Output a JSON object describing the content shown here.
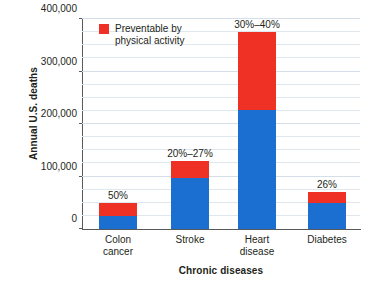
{
  "chart_data": {
    "type": "bar",
    "stacked": true,
    "title": "",
    "xlabel": "Chronic diseases",
    "ylabel": "Annual U.S. deaths",
    "categories": [
      "Colon cancer",
      "Stroke",
      "Heart disease",
      "Diabetes"
    ],
    "category_lines": [
      [
        "Colon",
        "cancer"
      ],
      [
        "Stroke"
      ],
      [
        "Heart",
        "disease"
      ],
      [
        "Diabetes"
      ]
    ],
    "series": [
      {
        "name": "Not preventable by physical activity",
        "color": "#1a6fd0",
        "values": [
          25000,
          97000,
          227000,
          50000
        ]
      },
      {
        "name": "Preventable by physical activity",
        "color": "#ee3124",
        "values": [
          25000,
          33000,
          148000,
          20000
        ]
      }
    ],
    "totals": [
      50000,
      130000,
      375000,
      70000
    ],
    "data_labels": [
      "50%",
      "20%–27%",
      "30%–40%",
      "26%"
    ],
    "ylim": [
      0,
      400000
    ],
    "yticks": [
      0,
      100000,
      200000,
      300000,
      400000
    ],
    "ytick_labels": [
      "0",
      "100,000",
      "200,000",
      "300,000",
      "400,000"
    ],
    "minor_tick_step": 25000,
    "grid": true,
    "legend_position": "upper-left-inside"
  },
  "legend": {
    "label": "Preventable by physical activity",
    "swatch_color": "#ee3124"
  },
  "colors": {
    "red": "#ee3124",
    "blue": "#1a6fd0",
    "axis": "#58595b",
    "grid": "#dfe7ef",
    "text": "#231f20",
    "background": "#ffffff"
  }
}
